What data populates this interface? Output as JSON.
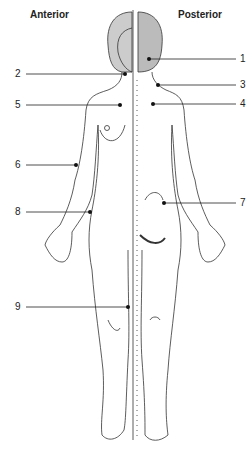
{
  "titles": {
    "left": "Anterior",
    "right": "Posterior"
  },
  "labels": [
    {
      "n": "1",
      "side": "right",
      "y": 59,
      "dot_x": 149
    },
    {
      "n": "2",
      "side": "left",
      "y": 74,
      "dot_x": 125
    },
    {
      "n": "3",
      "side": "right",
      "y": 85,
      "dot_x": 158
    },
    {
      "n": "4",
      "side": "right",
      "y": 104,
      "dot_x": 153
    },
    {
      "n": "5",
      "side": "left",
      "y": 105,
      "dot_x": 120
    },
    {
      "n": "6",
      "side": "left",
      "y": 165,
      "dot_x": 76
    },
    {
      "n": "7",
      "side": "right",
      "y": 203,
      "dot_x": 164
    },
    {
      "n": "8",
      "side": "left",
      "y": 212,
      "dot_x": 90
    },
    {
      "n": "9",
      "side": "left",
      "y": 307,
      "dot_x": 128
    }
  ],
  "colors": {
    "line": "#222222",
    "hair": "#bbbbbb"
  }
}
